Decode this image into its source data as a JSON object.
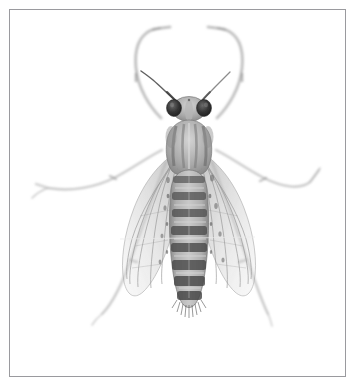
{
  "plate": {
    "title": "Insect specimen dorsal view",
    "medium": "grayscale photographic plate",
    "background_color": "#ffffff",
    "frame_color": "#9a9a9e",
    "frame_inset_px": 9,
    "caption": ""
  },
  "specimen": {
    "common_name": "fly",
    "order": "Diptera",
    "view": "dorsal",
    "orientation": "head up, abdomen down",
    "overall_tone": "pale gray wash with dark gray markings",
    "parts": [
      {
        "name": "head",
        "label": "Head",
        "center": [
          178,
          98
        ],
        "width": 34,
        "height": 24,
        "tone": "#8d8d8d"
      },
      {
        "name": "compound-eye-left",
        "label": "Left compound eye",
        "center": [
          163,
          97
        ],
        "width": 13,
        "height": 15,
        "tone": "#3a3a3a"
      },
      {
        "name": "compound-eye-right",
        "label": "Right compound eye",
        "center": [
          194,
          97
        ],
        "width": 13,
        "height": 15,
        "tone": "#3a3a3a"
      },
      {
        "name": "antenna-left",
        "label": "Left antenna",
        "tone": "#5a5a5a"
      },
      {
        "name": "antenna-right",
        "label": "Right antenna",
        "tone": "#6a6a6a"
      },
      {
        "name": "thorax",
        "label": "Thorax",
        "center": [
          180,
          135
        ],
        "width": 46,
        "height": 52,
        "tone": "#9e9e9e",
        "markings": "four longitudinal dark stripes"
      },
      {
        "name": "abdomen",
        "label": "Abdomen",
        "center": [
          180,
          225
        ],
        "width": 36,
        "height": 130,
        "tone": "#a8a8a8",
        "markings": "eight transverse dark bands"
      },
      {
        "name": "wing-left",
        "label": "Left wing",
        "tone": "#b8b8b8",
        "markings": "longitudinal venation"
      },
      {
        "name": "wing-right",
        "label": "Right wing",
        "tone": "#b8b8b8",
        "markings": "longitudinal venation"
      },
      {
        "name": "foreleg-left",
        "label": "Left foreleg",
        "tone": "#c8c8c8",
        "pose": "raised, arching above head"
      },
      {
        "name": "foreleg-right",
        "label": "Right foreleg",
        "tone": "#c8c8c8",
        "pose": "raised, arching above head"
      },
      {
        "name": "midleg-left",
        "label": "Left midleg",
        "tone": "#cfcfcf",
        "pose": "extended laterally to the left"
      },
      {
        "name": "midleg-right",
        "label": "Right midleg",
        "tone": "#cfcfcf",
        "pose": "extended laterally to the right"
      },
      {
        "name": "hindleg-left",
        "label": "Left hindleg",
        "tone": "#cfcfcf",
        "pose": "extended down and to the left"
      },
      {
        "name": "hindleg-right",
        "label": "Right hindleg",
        "tone": "#cfcfcf",
        "pose": "extended down and to the right"
      }
    ],
    "abdomen_bands": [
      {
        "index": 1,
        "y": 168,
        "height": 7,
        "tone": "#5e5e5e"
      },
      {
        "index": 2,
        "y": 184,
        "height": 8,
        "tone": "#555555"
      },
      {
        "index": 3,
        "y": 200,
        "height": 8,
        "tone": "#4f4f4f"
      },
      {
        "index": 4,
        "y": 216,
        "height": 9,
        "tone": "#4a4a4a"
      },
      {
        "index": 5,
        "y": 233,
        "height": 9,
        "tone": "#474747"
      },
      {
        "index": 6,
        "y": 250,
        "height": 10,
        "tone": "#444444"
      },
      {
        "index": 7,
        "y": 266,
        "height": 10,
        "tone": "#414141"
      },
      {
        "index": 8,
        "y": 281,
        "height": 9,
        "tone": "#3e3e3e"
      }
    ],
    "thorax_stripes": [
      {
        "index": 1,
        "x": 166,
        "tone": "#6f6f6f"
      },
      {
        "index": 2,
        "x": 174,
        "tone": "#7d7d7d"
      },
      {
        "index": 3,
        "x": 186,
        "tone": "#7d7d7d"
      },
      {
        "index": 4,
        "x": 194,
        "tone": "#6f6f6f"
      }
    ]
  },
  "colors": {
    "page": "#ffffff",
    "frame": "#9a9a9e",
    "eye_dark": "#2f2f2f",
    "body_mid": "#9b9b9b",
    "band_dark": "#474747",
    "wing_gray": "#b9b9b9",
    "leg_light": "#cccccc"
  }
}
